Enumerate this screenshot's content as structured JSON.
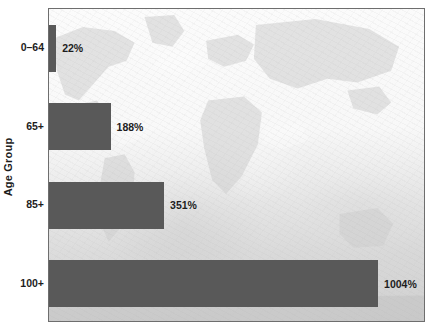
{
  "chart_data": {
    "type": "bar",
    "orientation": "horizontal",
    "title": "",
    "xlabel": "",
    "ylabel": "Age Group",
    "categories": [
      "0–64",
      "65+",
      "85+",
      "100+"
    ],
    "values": [
      22,
      188,
      351,
      1004
    ],
    "value_labels": [
      "22%",
      "188%",
      "351%",
      "1004%"
    ],
    "xlim": [
      0,
      1150
    ],
    "ylim": null,
    "grid": false,
    "legend": null,
    "series": [
      {
        "name": "Projected growth",
        "values": [
          22,
          188,
          351,
          1004
        ],
        "color": "#595959"
      }
    ],
    "annotations": [],
    "background": {
      "style": "world-map-watermark",
      "plot_fill": "#f2f2f2",
      "frame_color": "#6e6e6e"
    },
    "colors": {
      "bar": "#595959",
      "text": "#1d1d1d",
      "frame": "#6e6e6e",
      "plot_background": "#f2f2f2"
    }
  }
}
